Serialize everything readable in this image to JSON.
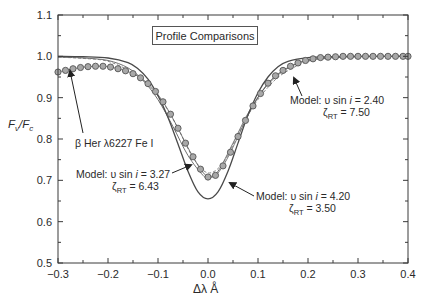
{
  "chart_data": {
    "type": "line",
    "title": "Profile Comparisons",
    "xlabel": "Δλ Å",
    "ylabel": "Fν/Fc",
    "xlim": [
      -0.3,
      0.4
    ],
    "ylim": [
      0.5,
      1.1
    ],
    "xticks": [
      -0.3,
      -0.2,
      -0.1,
      0.0,
      0.1,
      0.2,
      0.3,
      0.4
    ],
    "xtick_labels": [
      "−0.3",
      "−0.2",
      "−0.1",
      "0.0",
      "0.1",
      "0.2",
      "0.3",
      "0.4"
    ],
    "yticks": [
      0.5,
      0.6,
      0.7,
      0.8,
      0.9,
      1.0,
      1.1
    ],
    "ytick_labels": [
      "0.5",
      "0.6",
      "0.7",
      "0.8",
      "0.9",
      "1.0",
      "1.1"
    ],
    "grid": false,
    "series": [
      {
        "name": "β Her λ6227 Fe I (observed)",
        "style": "circles",
        "x": [
          -0.3,
          -0.285,
          -0.27,
          -0.255,
          -0.24,
          -0.225,
          -0.21,
          -0.195,
          -0.18,
          -0.165,
          -0.15,
          -0.135,
          -0.12,
          -0.105,
          -0.09,
          -0.075,
          -0.06,
          -0.045,
          -0.03,
          -0.015,
          0.0,
          0.015,
          0.03,
          0.045,
          0.06,
          0.075,
          0.09,
          0.105,
          0.12,
          0.135,
          0.15,
          0.165,
          0.18,
          0.195,
          0.21,
          0.225,
          0.24,
          0.255,
          0.27,
          0.285,
          0.3,
          0.315,
          0.33,
          0.345,
          0.36,
          0.375,
          0.39,
          0.4
        ],
        "y": [
          0.962,
          0.966,
          0.97,
          0.973,
          0.975,
          0.976,
          0.976,
          0.974,
          0.97,
          0.965,
          0.958,
          0.948,
          0.934,
          0.915,
          0.89,
          0.86,
          0.826,
          0.79,
          0.757,
          0.727,
          0.708,
          0.712,
          0.735,
          0.768,
          0.806,
          0.845,
          0.88,
          0.91,
          0.935,
          0.953,
          0.966,
          0.976,
          0.984,
          0.99,
          0.994,
          0.997,
          0.998,
          0.999,
          1.0,
          1.0,
          1.0,
          1.0,
          1.0,
          1.0,
          1.0,
          1.0,
          1.0,
          1.0
        ]
      },
      {
        "name": "Model: υ sin i = 3.27, ζRT = 6.43",
        "style": "dashed",
        "x": [
          -0.3,
          -0.25,
          -0.2,
          -0.15,
          -0.12,
          -0.09,
          -0.06,
          -0.03,
          0.0,
          0.03,
          0.06,
          0.09,
          0.12,
          0.15,
          0.2,
          0.25,
          0.3,
          0.4
        ],
        "y": [
          0.998,
          0.995,
          0.988,
          0.96,
          0.93,
          0.888,
          0.826,
          0.755,
          0.718,
          0.742,
          0.81,
          0.878,
          0.925,
          0.958,
          0.988,
          0.996,
          0.999,
          1.0
        ]
      },
      {
        "name": "Model: υ sin i = 2.40, ζRT = 7.50",
        "style": "solid-light",
        "x": [
          -0.3,
          -0.25,
          -0.2,
          -0.16,
          -0.13,
          -0.1,
          -0.07,
          -0.04,
          -0.01,
          0.0,
          0.02,
          0.05,
          0.08,
          0.11,
          0.14,
          0.17,
          0.2,
          0.25,
          0.3,
          0.4
        ],
        "y": [
          0.998,
          0.996,
          0.99,
          0.972,
          0.942,
          0.895,
          0.83,
          0.76,
          0.712,
          0.708,
          0.722,
          0.79,
          0.862,
          0.918,
          0.955,
          0.978,
          0.99,
          0.997,
          0.999,
          1.0
        ]
      },
      {
        "name": "Model: υ sin i = 4.20, ζRT = 3.50",
        "style": "solid",
        "x": [
          -0.3,
          -0.25,
          -0.2,
          -0.16,
          -0.14,
          -0.12,
          -0.1,
          -0.08,
          -0.06,
          -0.04,
          -0.02,
          0.0,
          0.02,
          0.04,
          0.06,
          0.08,
          0.1,
          0.12,
          0.14,
          0.16,
          0.2,
          0.25,
          0.3,
          0.4
        ],
        "y": [
          1.0,
          0.999,
          0.996,
          0.985,
          0.97,
          0.945,
          0.905,
          0.852,
          0.788,
          0.722,
          0.672,
          0.655,
          0.672,
          0.722,
          0.79,
          0.858,
          0.912,
          0.95,
          0.975,
          0.988,
          0.997,
          0.999,
          1.0,
          1.0
        ]
      }
    ],
    "annotations": [
      {
        "text": "β Her λ6227 Fe I",
        "x": -0.23,
        "y": 0.83
      },
      {
        "text": "Model: υ sin i = 2.40",
        "sub": "ζRT = 7.50",
        "x": 0.21,
        "y": 0.905
      },
      {
        "text": "Model: υ sin i = 3.27",
        "sub": "ζRT = 6.43",
        "x": -0.205,
        "y": 0.705
      },
      {
        "text": "Model: υ sin i = 4.20",
        "sub": "ζRT = 3.50",
        "x": 0.115,
        "y": 0.655
      }
    ]
  },
  "labels": {
    "title": "Profile Comparisons",
    "ylabel_main": "F",
    "ylabel_sub1": "ν",
    "ylabel_mid": "/F",
    "ylabel_sub2": "c",
    "xlabel": "Δλ  Å",
    "annot_obs": "β Her λ6227 Fe I",
    "annot_240_a": "Model: υ sin ",
    "annot_240_i": "i",
    "annot_240_b": " = 2.40",
    "annot_240_z": "ζ",
    "annot_240_zsub": "RT",
    "annot_240_zval": " = 7.50",
    "annot_327_a": "Model: υ sin ",
    "annot_327_i": "i",
    "annot_327_b": " = 3.27",
    "annot_327_z": "ζ",
    "annot_327_zsub": "RT",
    "annot_327_zval": " = 6.43",
    "annot_420_a": "Model: υ sin ",
    "annot_420_i": "i",
    "annot_420_b": " = 4.20",
    "annot_420_z": "ζ",
    "annot_420_zsub": "RT",
    "annot_420_zval": " = 3.50"
  },
  "colors": {
    "axis": "#3a3a3a",
    "model_solid": "#4a4a4a",
    "model_light": "#707070",
    "dashed": "#8a8a8a",
    "circle_fill": "#a8a8a8",
    "circle_stroke": "#555555"
  }
}
